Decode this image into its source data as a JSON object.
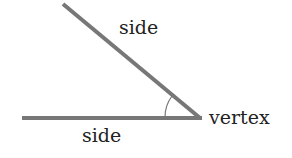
{
  "diagram": {
    "labels": {
      "upper_side": "side",
      "lower_side": "side",
      "vertex": "vertex"
    },
    "colors": {
      "stroke": "#777777",
      "text": "#222222"
    },
    "geometry": {
      "vertex": [
        200,
        118
      ],
      "upper_endpoint": [
        63,
        4
      ],
      "lower_endpoint": [
        22,
        118
      ]
    }
  }
}
